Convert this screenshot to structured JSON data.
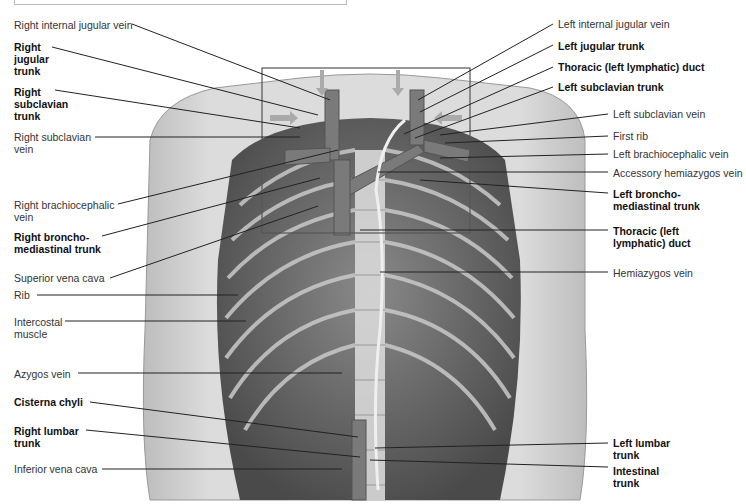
{
  "figure": {
    "colors": {
      "background": "#ffffff",
      "body": "#d6d6d6",
      "ribcage": "#6a6a6a",
      "vessel": "#7a7a7a",
      "leader": "#222222"
    }
  },
  "labels_left": [
    {
      "id": "right-internal-jugular-vein",
      "lines": [
        "Right internal jugular vein"
      ],
      "bold": false
    },
    {
      "id": "right-jugular-trunk",
      "lines": [
        "Right",
        "jugular",
        "trunk"
      ],
      "bold": true
    },
    {
      "id": "right-subclavian-trunk",
      "lines": [
        "Right",
        "subclavian",
        "trunk"
      ],
      "bold": true
    },
    {
      "id": "right-subclavian-vein",
      "lines": [
        "Right subclavian",
        "vein"
      ],
      "bold": false
    },
    {
      "id": "right-brachiocephalic-vein",
      "lines": [
        "Right brachiocephalic",
        "vein"
      ],
      "bold": false
    },
    {
      "id": "right-bronchomediastinal-trunk",
      "lines": [
        "Right broncho-",
        "mediastinal trunk"
      ],
      "bold": true
    },
    {
      "id": "superior-vena-cava",
      "lines": [
        "Superior vena cava"
      ],
      "bold": false
    },
    {
      "id": "rib",
      "lines": [
        "Rib"
      ],
      "bold": false
    },
    {
      "id": "intercostal-muscle",
      "lines": [
        "Intercostal",
        "muscle"
      ],
      "bold": false
    },
    {
      "id": "azygos-vein",
      "lines": [
        "Azygos vein"
      ],
      "bold": false
    },
    {
      "id": "cisterna-chyli",
      "lines": [
        "Cisterna chyli"
      ],
      "bold": true
    },
    {
      "id": "right-lumbar-trunk",
      "lines": [
        "Right lumbar",
        "trunk"
      ],
      "bold": true
    },
    {
      "id": "inferior-vena-cava",
      "lines": [
        "Inferior vena cava"
      ],
      "bold": false
    }
  ],
  "labels_right": [
    {
      "id": "left-internal-jugular-vein",
      "lines": [
        "Left internal jugular vein"
      ],
      "bold": false
    },
    {
      "id": "left-jugular-trunk",
      "lines": [
        "Left jugular trunk"
      ],
      "bold": true
    },
    {
      "id": "thoracic-duct-top",
      "lines": [
        "Thoracic (left lymphatic) duct"
      ],
      "bold": true
    },
    {
      "id": "left-subclavian-trunk",
      "lines": [
        "Left subclavian trunk"
      ],
      "bold": true
    },
    {
      "id": "left-subclavian-vein",
      "lines": [
        "Left subclavian vein"
      ],
      "bold": false
    },
    {
      "id": "first-rib",
      "lines": [
        "First rib"
      ],
      "bold": false
    },
    {
      "id": "left-brachiocephalic-vein",
      "lines": [
        "Left brachiocephalic vein"
      ],
      "bold": false
    },
    {
      "id": "accessory-hemiazygos-vein",
      "lines": [
        "Accessory hemiazygos vein"
      ],
      "bold": false
    },
    {
      "id": "left-bronchomediastinal-trunk",
      "lines": [
        "Left broncho-",
        "mediastinal trunk"
      ],
      "bold": true
    },
    {
      "id": "thoracic-duct-mid",
      "lines": [
        "Thoracic (left",
        "lymphatic) duct"
      ],
      "bold": true
    },
    {
      "id": "hemiazygos-vein",
      "lines": [
        "Hemiazygos vein"
      ],
      "bold": false
    },
    {
      "id": "left-lumbar-trunk",
      "lines": [
        "Left lumbar",
        "trunk"
      ],
      "bold": true
    },
    {
      "id": "intestinal-trunk",
      "lines": [
        "Intestinal",
        "trunk"
      ],
      "bold": true
    }
  ],
  "text": {
    "l0": "Right internal jugular vein",
    "l1a": "Right",
    "l1b": "jugular",
    "l1c": "trunk",
    "l2a": "Right",
    "l2b": "subclavian",
    "l2c": "trunk",
    "l3a": "Right subclavian",
    "l3b": "vein",
    "l4a": "Right brachiocephalic",
    "l4b": "vein",
    "l5a": "Right broncho-",
    "l5b": "mediastinal trunk",
    "l6": "Superior vena cava",
    "l7": "Rib",
    "l8a": "Intercostal",
    "l8b": "muscle",
    "l9": "Azygos vein",
    "l10": "Cisterna chyli",
    "l11a": "Right lumbar",
    "l11b": "trunk",
    "l12": "Inferior vena cava",
    "r0": "Left internal jugular vein",
    "r1": "Left jugular trunk",
    "r2": "Thoracic (left lymphatic) duct",
    "r3": "Left subclavian trunk",
    "r4": "Left subclavian vein",
    "r5": "First rib",
    "r6": "Left brachiocephalic vein",
    "r7": "Accessory hemiazygos vein",
    "r8a": "Left broncho-",
    "r8b": "mediastinal trunk",
    "r9a": "Thoracic (left",
    "r9b": "lymphatic) duct",
    "r10": "Hemiazygos vein",
    "r11a": "Left lumbar",
    "r11b": "trunk",
    "r12a": "Intestinal",
    "r12b": "trunk"
  }
}
